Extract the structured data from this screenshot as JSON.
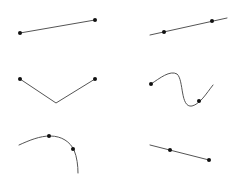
{
  "canvas": {
    "width": 241,
    "height": 184,
    "background": "#ffffff",
    "stroke_color": "#555555",
    "dot_color": "#111111"
  },
  "shapes": [
    {
      "id": "straight-segment",
      "kind": "line",
      "path": "M20,33 L95,20",
      "points": [
        [
          20,
          33
        ],
        [
          95,
          20
        ]
      ]
    },
    {
      "id": "line-through-two-points",
      "kind": "line",
      "path": "M150,35 L227,18",
      "points": [
        [
          164,
          32
        ],
        [
          212,
          21
        ]
      ]
    },
    {
      "id": "v-polyline",
      "kind": "polyline",
      "path": "M20,79 L56,103 L95,79",
      "points": [
        [
          20,
          79
        ],
        [
          95,
          79
        ]
      ]
    },
    {
      "id": "s-curve",
      "kind": "curve",
      "path": "M151,84 C160,78 170,70 177,74 C184,80 180,108 192,106 C200,104 206,94 213,85",
      "points": [
        [
          151,
          84
        ],
        [
          199,
          101
        ]
      ]
    },
    {
      "id": "arc-curve",
      "kind": "curve",
      "path": "M19,145 C30,140 40,136 50,136 C62,136 70,142 74,150 C77,157 78,166 78,173",
      "points": [
        [
          49,
          136
        ],
        [
          73,
          149
        ]
      ]
    },
    {
      "id": "ray-segment",
      "kind": "line",
      "path": "M150,145 L209,160",
      "points": [
        [
          170,
          150
        ],
        [
          209,
          160
        ]
      ]
    }
  ]
}
